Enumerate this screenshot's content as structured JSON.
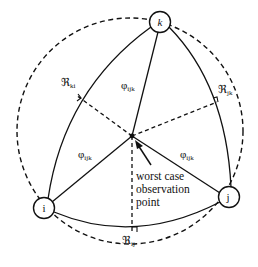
{
  "diagram": {
    "type": "geometric-network-diagram",
    "colors": {
      "stroke": "#111111",
      "background": "#ffffff"
    },
    "nodes": [
      {
        "id": "k",
        "label": "k",
        "cx": 160,
        "cy": 22
      },
      {
        "id": "i",
        "label": "i",
        "cx": 44,
        "cy": 208
      },
      {
        "id": "j",
        "label": "j",
        "cx": 229,
        "cy": 197
      }
    ],
    "observation_point": {
      "x": 132,
      "y": 136
    },
    "labels": {
      "r_ki": {
        "main": "ℜ",
        "sub": "ki"
      },
      "r_jk": {
        "main": "ℜ",
        "sub": "jk"
      },
      "r_ij": {
        "main": "ℜ",
        "sub": "ij"
      },
      "phi_top": {
        "main": "φ",
        "sub": "ijk"
      },
      "phi_left": {
        "main": "φ",
        "sub": "ijk"
      },
      "phi_right": {
        "main": "φ",
        "sub": "ijk"
      }
    },
    "annotation": {
      "line1": "worst case",
      "line2": "observation",
      "line3": "point"
    },
    "edges": [
      {
        "from": "k",
        "to": "i",
        "style": "solid-arc"
      },
      {
        "from": "k",
        "to": "j",
        "style": "solid-arc"
      },
      {
        "from": "i",
        "to": "j",
        "style": "solid-arc"
      },
      {
        "from": "observation_point",
        "to": "k",
        "style": "solid"
      },
      {
        "from": "observation_point",
        "to": "i",
        "style": "solid"
      },
      {
        "from": "observation_point",
        "to": "j",
        "style": "solid"
      },
      {
        "from": "observation_point",
        "to": "r_ki_foot",
        "style": "dashed-perpendicular"
      },
      {
        "from": "observation_point",
        "to": "r_jk_foot",
        "style": "dashed-perpendicular"
      },
      {
        "from": "observation_point",
        "to": "r_ij_foot",
        "style": "dashed-perpendicular"
      }
    ],
    "enclosing_circle": {
      "style": "dashed",
      "cx": 130,
      "cy": 131,
      "r": 113
    }
  }
}
